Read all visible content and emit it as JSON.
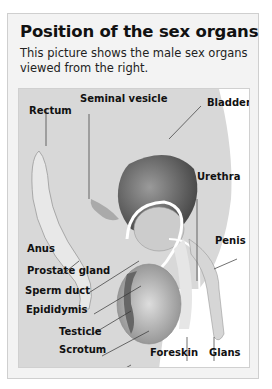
{
  "title": "Position of the sex organs",
  "subtitle": "This picture shows the male sex organs viewed from the right.",
  "figure": {
    "labels": {
      "seminal_vesicle": "Seminal vesicle",
      "bladder": "Bladder",
      "rectum": "Rectum",
      "urethra": "Urethra",
      "penis": "Penis",
      "anus": "Anus",
      "prostate_gland": "Prostate gland",
      "sperm_duct": "Sperm duct",
      "epididymis": "Epididymis",
      "testicle": "Testicle",
      "scrotum": "Scrotum",
      "foreskin": "Foreskin",
      "glans": "Glans"
    }
  }
}
